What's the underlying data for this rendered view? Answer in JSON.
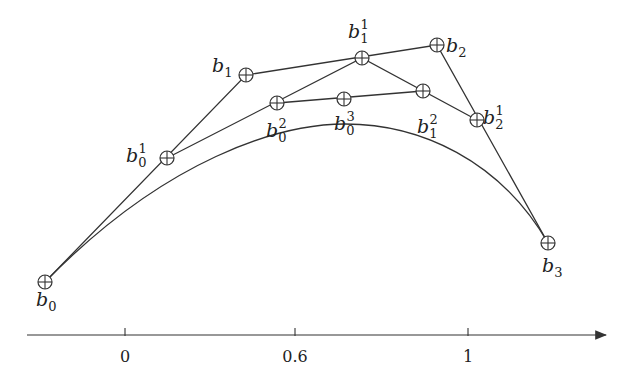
{
  "points": {
    "b0": {
      "label": "b",
      "sub": "0",
      "sup": "",
      "x": 45,
      "y": 282
    },
    "b1": {
      "label": "b",
      "sub": "1",
      "sup": "",
      "x": 246,
      "y": 75
    },
    "b2": {
      "label": "b",
      "sub": "2",
      "sup": "",
      "x": 437,
      "y": 45
    },
    "b3": {
      "label": "b",
      "sub": "3",
      "sup": "",
      "x": 548,
      "y": 243
    },
    "b0_1": {
      "label": "b",
      "sub": "0",
      "sup": "1",
      "x": 167,
      "y": 158
    },
    "b1_1": {
      "label": "b",
      "sub": "1",
      "sup": "1",
      "x": 362,
      "y": 58
    },
    "b2_1": {
      "label": "b",
      "sub": "2",
      "sup": "1",
      "x": 477,
      "y": 120
    },
    "b0_2": {
      "label": "b",
      "sub": "0",
      "sup": "2",
      "x": 277,
      "y": 103
    },
    "b1_2": {
      "label": "b",
      "sub": "1",
      "sup": "2",
      "x": 423,
      "y": 91
    },
    "b0_3": {
      "label": "b",
      "sub": "0",
      "sup": "3",
      "x": 344,
      "y": 99
    }
  },
  "labels": {
    "b0": {
      "text": "b",
      "sub": "0",
      "x": 36,
      "y": 306
    },
    "b1": {
      "text": "b",
      "sub": "1",
      "x": 212,
      "y": 72
    },
    "b2": {
      "text": "b",
      "sub": "2",
      "x": 446,
      "y": 52
    },
    "b3": {
      "text": "b",
      "sub": "3",
      "x": 542,
      "y": 272
    },
    "b0_1": {
      "text": "b",
      "sub": "0",
      "sup": "1",
      "x": 126,
      "y": 162
    },
    "b1_1": {
      "text": "b",
      "sub": "1",
      "sup": "1",
      "x": 348,
      "y": 38
    },
    "b2_1": {
      "text": "b",
      "sub": "2",
      "sup": "1",
      "x": 483,
      "y": 124
    },
    "b0_2": {
      "text": "b",
      "sub": "0",
      "sup": "2",
      "x": 266,
      "y": 137
    },
    "b1_2": {
      "text": "b",
      "sub": "1",
      "sup": "2",
      "x": 417,
      "y": 133
    },
    "b0_3": {
      "text": "b",
      "sub": "0",
      "sup": "3",
      "x": 334,
      "y": 130
    }
  },
  "axis": {
    "x_start": 27,
    "x_end": 608,
    "y": 335,
    "ticks": [
      {
        "label": "0",
        "x": 125
      },
      {
        "label": "0.6",
        "x": 295
      },
      {
        "label": "1",
        "x": 468
      }
    ]
  },
  "colors": {
    "stroke": "#333333",
    "background": "#ffffff"
  }
}
